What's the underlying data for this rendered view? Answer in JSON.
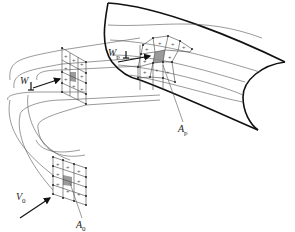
{
  "diagram": {
    "type": "streamtube-flow-schematic",
    "labels": {
      "W": {
        "main": "W",
        "sub": ""
      },
      "Wp": {
        "main": "W",
        "sub": "p"
      },
      "Ap": {
        "main": "A",
        "sub": "p"
      },
      "V0": {
        "main": "V",
        "sub": "0"
      },
      "A0": {
        "main": "A",
        "sub": "0"
      }
    },
    "elements": [
      "cylinder-body",
      "curved-streamtube",
      "grid-at-inlet-A0",
      "grid-intermediate",
      "grid-at-cylinder-Ap",
      "velocity-arrow-V0",
      "velocity-arrow-W",
      "velocity-arrow-Wp"
    ],
    "colors": {
      "line": "#555555",
      "outline": "#111111",
      "shade": "#8a8a8a",
      "background": "#ffffff"
    }
  }
}
